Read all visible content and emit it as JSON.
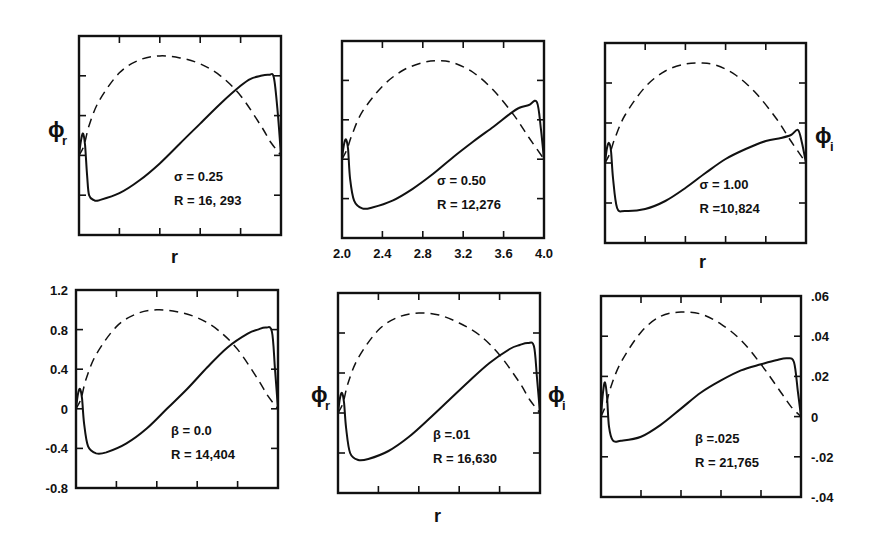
{
  "figure": {
    "line_color": "#111111",
    "background": "#ffffff"
  },
  "chart_data": [
    {
      "type": "line",
      "panel": "top-left",
      "annotation": [
        "σ = 0.25",
        "R = 16, 293"
      ],
      "parameter": {
        "name": "σ",
        "value": 0.25
      },
      "R": 16293,
      "ylabel_left": "ϕr",
      "xlabel": "r",
      "xlim": [
        2.0,
        4.0
      ],
      "ylim": [
        -0.8,
        1.2
      ],
      "grid": false,
      "series": [
        {
          "name": "ϕr",
          "style": "solid",
          "x": [
            2.0,
            2.02,
            2.04,
            2.06,
            2.08,
            2.1,
            2.15,
            2.2,
            2.4,
            2.6,
            2.8,
            3.0,
            3.2,
            3.4,
            3.6,
            3.7,
            3.8,
            3.88,
            3.93,
            3.97,
            4.0
          ],
          "y": [
            0.0,
            0.15,
            0.22,
            0.1,
            -0.2,
            -0.4,
            -0.45,
            -0.45,
            -0.38,
            -0.25,
            -0.08,
            0.12,
            0.32,
            0.52,
            0.7,
            0.77,
            0.8,
            0.81,
            0.78,
            0.4,
            0.0
          ]
        },
        {
          "name": "ϕi",
          "style": "dashed",
          "x": [
            2.0,
            2.05,
            2.1,
            2.2,
            2.4,
            2.6,
            2.8,
            3.0,
            3.2,
            3.4,
            3.6,
            3.8,
            3.9,
            4.0
          ],
          "y": [
            0.0,
            0.1,
            0.3,
            0.55,
            0.83,
            0.96,
            1.0,
            0.98,
            0.92,
            0.8,
            0.6,
            0.3,
            0.13,
            0.0
          ]
        }
      ]
    },
    {
      "type": "line",
      "panel": "top-middle",
      "annotation": [
        "σ = 0.50",
        "R = 12,276"
      ],
      "parameter": {
        "name": "σ",
        "value": 0.5
      },
      "R": 12276,
      "xlabel": "",
      "xticks": [
        "2.0",
        "2.4",
        "2.8",
        "3.2",
        "3.6",
        "4.0"
      ],
      "xlim": [
        2.0,
        4.0
      ],
      "ylim": [
        -0.8,
        1.2
      ],
      "grid": false,
      "series": [
        {
          "name": "ϕr",
          "style": "solid",
          "x": [
            2.0,
            2.02,
            2.04,
            2.06,
            2.08,
            2.12,
            2.2,
            2.3,
            2.5,
            2.7,
            2.9,
            3.1,
            3.3,
            3.5,
            3.65,
            3.75,
            3.85,
            3.93,
            3.97,
            4.0
          ],
          "y": [
            0.0,
            0.15,
            0.2,
            0.1,
            -0.2,
            -0.42,
            -0.5,
            -0.49,
            -0.42,
            -0.3,
            -0.15,
            0.02,
            0.18,
            0.33,
            0.45,
            0.52,
            0.55,
            0.58,
            0.3,
            0.0
          ]
        },
        {
          "name": "ϕi",
          "style": "dashed",
          "x": [
            2.0,
            2.05,
            2.1,
            2.2,
            2.4,
            2.6,
            2.8,
            2.95,
            3.1,
            3.3,
            3.5,
            3.7,
            3.85,
            4.0
          ],
          "y": [
            0.0,
            0.1,
            0.25,
            0.48,
            0.74,
            0.9,
            0.98,
            1.0,
            0.98,
            0.88,
            0.7,
            0.45,
            0.22,
            0.0
          ]
        }
      ]
    },
    {
      "type": "line",
      "panel": "top-right",
      "annotation": [
        "σ = 1.00",
        "R =10,824"
      ],
      "parameter": {
        "name": "σ",
        "value": 1.0
      },
      "R": 10824,
      "ylabel_right": "ϕi",
      "xlabel": "r",
      "xlim": [
        2.0,
        4.0
      ],
      "ylim": [
        -0.8,
        1.2
      ],
      "grid": false,
      "series": [
        {
          "name": "ϕr",
          "style": "solid",
          "x": [
            2.0,
            2.02,
            2.04,
            2.06,
            2.08,
            2.12,
            2.2,
            2.4,
            2.6,
            2.8,
            3.0,
            3.2,
            3.4,
            3.6,
            3.75,
            3.85,
            3.92,
            3.96,
            4.0
          ],
          "y": [
            0.0,
            0.15,
            0.2,
            0.12,
            -0.15,
            -0.45,
            -0.48,
            -0.46,
            -0.38,
            -0.25,
            -0.1,
            0.04,
            0.14,
            0.22,
            0.25,
            0.28,
            0.33,
            0.2,
            0.0
          ]
        },
        {
          "name": "ϕi",
          "style": "dashed",
          "x": [
            2.0,
            2.05,
            2.1,
            2.2,
            2.4,
            2.6,
            2.8,
            2.95,
            3.1,
            3.3,
            3.5,
            3.7,
            3.85,
            4.0
          ],
          "y": [
            0.0,
            0.1,
            0.25,
            0.48,
            0.76,
            0.92,
            0.99,
            1.0,
            0.98,
            0.88,
            0.7,
            0.45,
            0.22,
            0.0
          ]
        }
      ]
    },
    {
      "type": "line",
      "panel": "bottom-left",
      "annotation": [
        "β = 0.0",
        "R = 14,404"
      ],
      "parameter": {
        "name": "β",
        "value": 0.0
      },
      "R": 14404,
      "yticks": [
        "1.2",
        "0.8",
        "0.4",
        "0",
        "-0.4",
        "-0.8"
      ],
      "ylim": [
        -0.8,
        1.2
      ],
      "xlim": [
        2.0,
        4.0
      ],
      "grid": false,
      "series": [
        {
          "name": "ϕr",
          "style": "solid",
          "x": [
            2.0,
            2.02,
            2.04,
            2.06,
            2.08,
            2.12,
            2.2,
            2.3,
            2.5,
            2.7,
            2.9,
            3.1,
            3.3,
            3.5,
            3.7,
            3.8,
            3.88,
            3.94,
            3.97,
            4.0
          ],
          "y": [
            0.0,
            0.15,
            0.2,
            0.1,
            -0.15,
            -0.38,
            -0.45,
            -0.44,
            -0.35,
            -0.2,
            0.0,
            0.2,
            0.42,
            0.62,
            0.76,
            0.8,
            0.82,
            0.78,
            0.4,
            0.0
          ]
        },
        {
          "name": "ϕi",
          "style": "dashed",
          "x": [
            2.0,
            2.05,
            2.1,
            2.2,
            2.4,
            2.6,
            2.8,
            3.0,
            3.2,
            3.4,
            3.6,
            3.8,
            3.9,
            4.0
          ],
          "y": [
            0.0,
            0.1,
            0.3,
            0.55,
            0.83,
            0.96,
            1.0,
            0.98,
            0.92,
            0.8,
            0.6,
            0.3,
            0.13,
            0.0
          ]
        }
      ]
    },
    {
      "type": "line",
      "panel": "bottom-middle",
      "annotation": [
        "β =.01",
        "R = 16,630"
      ],
      "parameter": {
        "name": "β",
        "value": 0.01
      },
      "R": 16630,
      "ylabel_left": "ϕr",
      "ylabel_right": "ϕi",
      "xlabel": "r",
      "xlim": [
        2.0,
        4.0
      ],
      "ylim": [
        -0.8,
        1.2
      ],
      "grid": false,
      "series": [
        {
          "name": "ϕr",
          "style": "solid",
          "x": [
            2.0,
            2.02,
            2.04,
            2.06,
            2.08,
            2.12,
            2.2,
            2.3,
            2.5,
            2.7,
            2.9,
            3.1,
            3.3,
            3.5,
            3.7,
            3.8,
            3.88,
            3.94,
            3.97,
            4.0
          ],
          "y": [
            0.0,
            0.15,
            0.2,
            0.1,
            -0.15,
            -0.4,
            -0.47,
            -0.46,
            -0.38,
            -0.24,
            -0.06,
            0.13,
            0.32,
            0.5,
            0.64,
            0.68,
            0.7,
            0.67,
            0.35,
            0.0
          ]
        },
        {
          "name": "ϕi",
          "style": "dashed",
          "x": [
            2.0,
            2.05,
            2.1,
            2.2,
            2.4,
            2.6,
            2.8,
            3.0,
            3.2,
            3.4,
            3.6,
            3.8,
            3.9,
            4.0
          ],
          "y": [
            0.0,
            0.1,
            0.3,
            0.55,
            0.83,
            0.96,
            1.0,
            0.98,
            0.9,
            0.78,
            0.58,
            0.3,
            0.13,
            0.0
          ]
        }
      ]
    },
    {
      "type": "line",
      "panel": "bottom-right",
      "annotation": [
        "β =.025",
        "R = 21,765"
      ],
      "parameter": {
        "name": "β",
        "value": 0.025
      },
      "R": 21765,
      "yticks_right": [
        ".06",
        ".04",
        ".02",
        "0",
        "-.02",
        "-.04"
      ],
      "ylim_right": [
        -0.04,
        0.06
      ],
      "xlim": [
        2.0,
        4.0
      ],
      "grid": false,
      "series": [
        {
          "name": "ϕr",
          "style": "solid",
          "x": [
            2.0,
            2.02,
            2.04,
            2.06,
            2.08,
            2.12,
            2.2,
            2.4,
            2.6,
            2.8,
            3.0,
            3.2,
            3.4,
            3.6,
            3.75,
            3.86,
            3.93,
            3.97,
            4.0
          ],
          "y": [
            0.0,
            0.012,
            0.017,
            0.01,
            -0.005,
            -0.012,
            -0.012,
            -0.01,
            -0.004,
            0.004,
            0.012,
            0.018,
            0.023,
            0.026,
            0.028,
            0.029,
            0.027,
            0.012,
            0.0
          ]
        },
        {
          "name": "ϕi",
          "style": "dashed",
          "x": [
            2.0,
            2.05,
            2.1,
            2.2,
            2.4,
            2.6,
            2.8,
            3.0,
            3.2,
            3.4,
            3.6,
            3.8,
            3.9,
            4.0
          ],
          "y": [
            0.0,
            0.006,
            0.015,
            0.027,
            0.042,
            0.05,
            0.052,
            0.051,
            0.046,
            0.038,
            0.026,
            0.012,
            0.005,
            0.0
          ]
        }
      ]
    }
  ],
  "layout": {
    "panels": [
      {
        "left": 79,
        "top": 36,
        "width": 202,
        "height": 199
      },
      {
        "left": 342,
        "top": 41,
        "width": 202,
        "height": 197
      },
      {
        "left": 605,
        "top": 43,
        "width": 201,
        "height": 200
      },
      {
        "left": 76,
        "top": 290,
        "width": 202,
        "height": 198
      },
      {
        "left": 338,
        "top": 293,
        "width": 202,
        "height": 200
      },
      {
        "left": 601,
        "top": 296,
        "width": 200,
        "height": 201
      }
    ]
  },
  "labels": {
    "r": "r",
    "phi": "ϕ",
    "sub_r": "r",
    "sub_i": "i"
  }
}
